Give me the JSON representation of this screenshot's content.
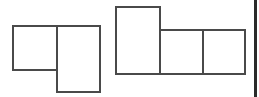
{
  "diagram": {
    "stroke_color": "#4a4a4a",
    "figures": [
      {
        "name": "figure-left",
        "cells": [
          {
            "name": "left-square",
            "x": 12,
            "y": 25,
            "w": 46,
            "h": 46
          },
          {
            "name": "left-tall-rect",
            "x": 56,
            "y": 25,
            "w": 45,
            "h": 68
          }
        ]
      },
      {
        "name": "figure-right",
        "cells": [
          {
            "name": "right-tall-rect",
            "x": 115,
            "y": 6,
            "w": 46,
            "h": 69
          },
          {
            "name": "right-square-middle",
            "x": 159,
            "y": 29,
            "w": 45,
            "h": 46
          },
          {
            "name": "right-square-end",
            "x": 202,
            "y": 29,
            "w": 44,
            "h": 46
          }
        ]
      }
    ],
    "edge_bar": {
      "x": 254,
      "w": 3,
      "color": "#2a2a2a"
    }
  }
}
